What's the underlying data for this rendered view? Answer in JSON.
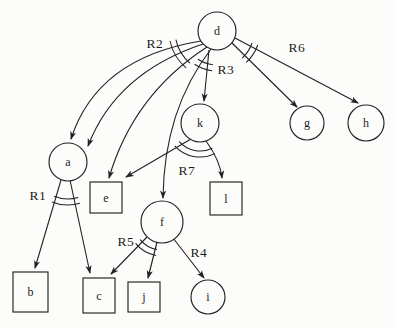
{
  "figure": {
    "type": "hypergraph-relation-diagram",
    "background": "#fcfcfb",
    "ink": "#222222",
    "nodes": [
      {
        "id": "d",
        "shape": "circle",
        "label": "d",
        "cx": 217,
        "cy": 31,
        "r": 19
      },
      {
        "id": "k",
        "shape": "circle",
        "label": "k",
        "cx": 200,
        "cy": 123,
        "r": 19
      },
      {
        "id": "g",
        "shape": "circle",
        "label": "g",
        "cx": 307,
        "cy": 123,
        "r": 17
      },
      {
        "id": "h",
        "shape": "circle",
        "label": "h",
        "cx": 366,
        "cy": 123,
        "r": 18
      },
      {
        "id": "a",
        "shape": "circle",
        "label": "a",
        "cx": 68,
        "cy": 162,
        "r": 19
      },
      {
        "id": "f",
        "shape": "circle",
        "label": "f",
        "cx": 162,
        "cy": 222,
        "r": 21
      },
      {
        "id": "i",
        "shape": "circle",
        "label": "i",
        "cx": 208,
        "cy": 297,
        "r": 17
      },
      {
        "id": "e",
        "shape": "square",
        "label": "e",
        "x": 90,
        "y": 182,
        "w": 32,
        "h": 31
      },
      {
        "id": "l",
        "shape": "square",
        "label": "l",
        "x": 210,
        "y": 182,
        "w": 32,
        "h": 33
      },
      {
        "id": "b",
        "shape": "square",
        "label": "b",
        "x": 13,
        "y": 272,
        "w": 35,
        "h": 40
      },
      {
        "id": "c",
        "shape": "square",
        "label": "c",
        "x": 83,
        "y": 278,
        "w": 32,
        "h": 35
      },
      {
        "id": "j",
        "shape": "square",
        "label": "j",
        "x": 128,
        "y": 282,
        "w": 32,
        "h": 30
      }
    ],
    "edges": [
      {
        "from": "d",
        "to": "a",
        "path": "M 201,41 Q 97,58 71,139"
      },
      {
        "from": "d",
        "to": "a",
        "path": "M 203,44 Q 116,73 88,146"
      },
      {
        "from": "d",
        "to": "e",
        "path": "M 207,47 Q 133,95 109,178"
      },
      {
        "from": "d",
        "to": "f",
        "path": "M 211,49 Q 164,110 163,198"
      },
      {
        "from": "d",
        "to": "k",
        "path": "M 209,50 L 204,101"
      },
      {
        "from": "d",
        "to": "g",
        "path": "M 232,43 L 297,107"
      },
      {
        "from": "d",
        "to": "h",
        "path": "M 235,38 L 358,103"
      },
      {
        "from": "k",
        "to": "e",
        "path": "M 191,139 L 126,177"
      },
      {
        "from": "k",
        "to": "l",
        "path": "M 206,141 Q 220,160 222,178"
      },
      {
        "from": "a",
        "to": "b",
        "path": "M 61,180 L 35,268"
      },
      {
        "from": "a",
        "to": "c",
        "path": "M 70,180 L 90,273"
      },
      {
        "from": "f",
        "to": "c",
        "path": "M 147,237 L 111,274"
      },
      {
        "from": "f",
        "to": "j",
        "path": "M 157,242 L 148,278"
      },
      {
        "from": "f",
        "to": "i",
        "path": "M 173,238 L 204,278"
      }
    ],
    "group_marks": [
      {
        "relation": "R2",
        "cx": 217,
        "cy": 31,
        "r1": 42,
        "r2": 48,
        "a1": 130,
        "a2": 168
      },
      {
        "relation": "R3",
        "cx": 217,
        "cy": 31,
        "r1": 34,
        "r2": 40,
        "a1": 97,
        "a2": 124
      },
      {
        "relation": "R6",
        "cx": 217,
        "cy": 31,
        "r1": 37,
        "r2": 43,
        "a1": 19,
        "a2": 47
      },
      {
        "relation": "R1",
        "cx": 68,
        "cy": 162,
        "r1": 37,
        "r2": 43,
        "a1": 74,
        "a2": 112
      },
      {
        "relation": "R7",
        "cx": 200,
        "cy": 123,
        "r1": 28,
        "r2": 34,
        "a1": 64,
        "a2": 138
      },
      {
        "relation": "R5",
        "cx": 162,
        "cy": 222,
        "r1": 28,
        "r2": 34,
        "a1": 100,
        "a2": 141
      }
    ],
    "relation_labels": [
      {
        "text": "R2",
        "x": 155,
        "y": 43
      },
      {
        "text": "R3",
        "x": 226,
        "y": 69
      },
      {
        "text": "R6",
        "x": 297,
        "y": 47
      },
      {
        "text": "R7",
        "x": 187,
        "y": 170
      },
      {
        "text": "R1",
        "x": 38,
        "y": 195
      },
      {
        "text": "R5",
        "x": 126,
        "y": 241
      },
      {
        "text": "R4",
        "x": 199,
        "y": 252
      }
    ]
  }
}
